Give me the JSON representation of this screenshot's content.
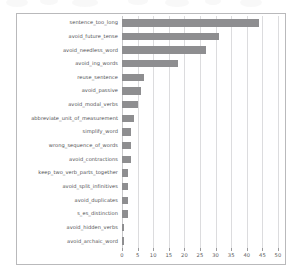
{
  "figure": {
    "background_color": "#ffffff",
    "frame_color": "#b9b9bb",
    "bar_color": "#8e8e90",
    "grid_color": "#dcdcde",
    "title": ""
  },
  "chart_data": {
    "type": "bar",
    "orientation": "horizontal",
    "title": "",
    "xlabel": "",
    "ylabel": "",
    "xlim": [
      0,
      50
    ],
    "ylim": [
      0,
      17
    ],
    "grid": true,
    "legend": false,
    "xticks": [
      0,
      5,
      10,
      15,
      20,
      25,
      30,
      35,
      40,
      45,
      50
    ],
    "xtick_labels": [
      "0",
      "5",
      "10",
      "15",
      "20",
      "25",
      "30",
      "35",
      "40",
      "45",
      "50"
    ],
    "categories": [
      "sentence_too_long",
      "avoid_future_tense",
      "avoid_needless_word",
      "avoid_ing_words",
      "reuse_sentence",
      "avoid_passive",
      "avoid_modal_verbs",
      "abbreviate_unit_of_measurement",
      "simplify_word",
      "wrong_sequence_of_words",
      "avoid_contractions",
      "keep_two_verb_parts_together",
      "avoid_split_infinitives",
      "avoid_duplicates",
      "s_es_distinction",
      "avoid_hidden_verbs",
      "avoid_archaic_word"
    ],
    "values": [
      44,
      31,
      27,
      18,
      7,
      6,
      5,
      4,
      3,
      3,
      3,
      2,
      2,
      2,
      2,
      0.6,
      0.6
    ]
  }
}
